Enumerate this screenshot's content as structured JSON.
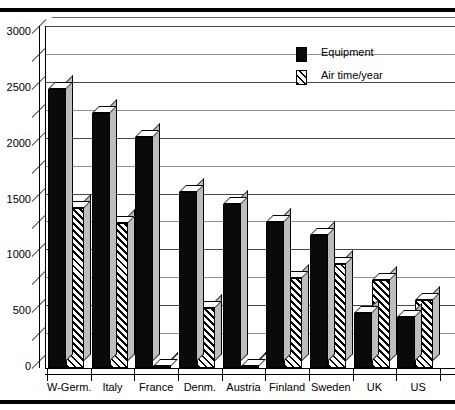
{
  "page": {
    "clipped_header_text": "",
    "background_color": "#ffffff",
    "rule_color": "#000000"
  },
  "legend": {
    "position": "top-center-right",
    "items": [
      {
        "label": "Equipment",
        "swatch": "solid-black-swatch",
        "color": "#0a0a0a"
      },
      {
        "label": "Air time/year",
        "swatch": "diagonal-hatch-swatch",
        "color": "#000000"
      }
    ]
  },
  "chart_data": {
    "type": "bar",
    "title": "",
    "subtitle": "",
    "xlabel": "",
    "ylabel": "",
    "ylim": [
      0,
      3000
    ],
    "ytick_step": 500,
    "yminor_step": 250,
    "grid": true,
    "style": "3d-clustered-column",
    "legend_position": "top-right",
    "categories": [
      "W-Germ.",
      "Italy",
      "France",
      "Denm.",
      "Austria",
      "Finland",
      "Sweden",
      "UK",
      "US"
    ],
    "yticks": [
      "0",
      "500",
      "1000",
      "1500",
      "2000",
      "2500",
      "3000"
    ],
    "series": [
      {
        "name": "Equipment",
        "values": [
          2500,
          2280,
          2070,
          1580,
          1470,
          1310,
          1190,
          490,
          460
        ]
      },
      {
        "name": "Air time/year",
        "values": [
          1430,
          1300,
          20,
          540,
          20,
          810,
          930,
          790,
          610
        ]
      }
    ]
  }
}
